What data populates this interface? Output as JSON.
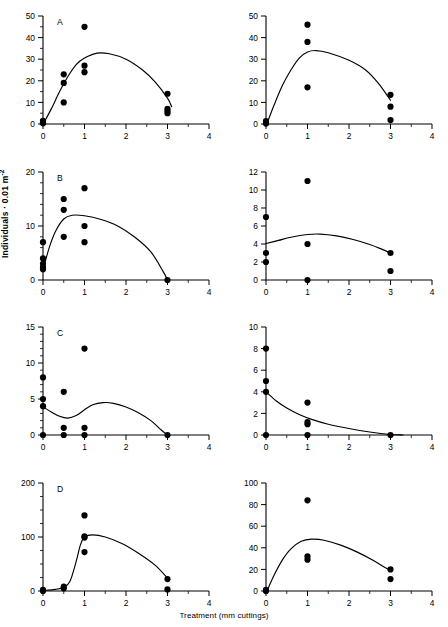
{
  "figure": {
    "xlabel": "Treatment (mm cuttings)",
    "ylabel_main": "Individuals · 0.01 m",
    "ylabel_exp": "-2",
    "ylabel_full": "Individuals · 0.01 m-2"
  },
  "chart_data": [
    {
      "id": "panel-A-left",
      "type": "scatter",
      "panel_label": "A",
      "xlabel": "Treatment (mm cuttings)",
      "ylabel": "Individuals · 0.01 m-2",
      "xlim": [
        0,
        4
      ],
      "ylim": [
        0,
        50
      ],
      "xticks": [
        0,
        1,
        2,
        3,
        4
      ],
      "yticks": [
        0,
        10,
        20,
        30,
        40,
        50
      ],
      "minor_xticks": [
        0.5,
        1.5,
        2.5,
        3.5
      ],
      "minor_yticks": [
        5,
        15,
        25,
        35,
        45
      ],
      "grid": false,
      "legend": "none",
      "points": [
        {
          "x": 0,
          "y": 1.5
        },
        {
          "x": 0,
          "y": 0.8
        },
        {
          "x": 0,
          "y": 0.3
        },
        {
          "x": 0.5,
          "y": 23
        },
        {
          "x": 0.5,
          "y": 19
        },
        {
          "x": 0.5,
          "y": 10
        },
        {
          "x": 1,
          "y": 45
        },
        {
          "x": 1,
          "y": 27
        },
        {
          "x": 1,
          "y": 24
        },
        {
          "x": 3,
          "y": 14
        },
        {
          "x": 3,
          "y": 7
        },
        {
          "x": 3,
          "y": 6
        },
        {
          "x": 3,
          "y": 5
        }
      ],
      "curve": [
        {
          "x": 0.02,
          "y": 0.5
        },
        {
          "x": 0.2,
          "y": 7
        },
        {
          "x": 0.4,
          "y": 15
        },
        {
          "x": 0.6,
          "y": 22
        },
        {
          "x": 0.8,
          "y": 27.5
        },
        {
          "x": 1.0,
          "y": 30.5
        },
        {
          "x": 1.3,
          "y": 32.8
        },
        {
          "x": 1.6,
          "y": 32.5
        },
        {
          "x": 2.0,
          "y": 30
        },
        {
          "x": 2.4,
          "y": 25
        },
        {
          "x": 2.7,
          "y": 19.5
        },
        {
          "x": 3.0,
          "y": 12
        },
        {
          "x": 3.1,
          "y": 8
        }
      ]
    },
    {
      "id": "panel-A-right",
      "type": "scatter",
      "panel_label": "",
      "xlim": [
        0,
        4
      ],
      "ylim": [
        0,
        50
      ],
      "xticks": [
        0,
        1,
        2,
        3,
        4
      ],
      "yticks": [
        0,
        10,
        20,
        30,
        40,
        50
      ],
      "minor_xticks": [
        0.5,
        1.5,
        2.5,
        3.5
      ],
      "minor_yticks": [],
      "grid": false,
      "points": [
        {
          "x": 0,
          "y": 1.4
        },
        {
          "x": 0,
          "y": 0.6
        },
        {
          "x": 0,
          "y": 0.2
        },
        {
          "x": 1,
          "y": 46
        },
        {
          "x": 1,
          "y": 38
        },
        {
          "x": 1,
          "y": 17
        },
        {
          "x": 3,
          "y": 13.5
        },
        {
          "x": 3,
          "y": 8
        },
        {
          "x": 3,
          "y": 1.8
        }
      ],
      "curve": [
        {
          "x": 0.03,
          "y": 0.5
        },
        {
          "x": 0.2,
          "y": 9
        },
        {
          "x": 0.4,
          "y": 18
        },
        {
          "x": 0.6,
          "y": 25
        },
        {
          "x": 0.8,
          "y": 30.5
        },
        {
          "x": 1.0,
          "y": 33.3
        },
        {
          "x": 1.2,
          "y": 34
        },
        {
          "x": 1.5,
          "y": 33
        },
        {
          "x": 2.0,
          "y": 29.5
        },
        {
          "x": 2.4,
          "y": 25
        },
        {
          "x": 2.7,
          "y": 19
        },
        {
          "x": 3.0,
          "y": 11
        }
      ]
    },
    {
      "id": "panel-B-left",
      "type": "scatter",
      "panel_label": "B",
      "xlim": [
        0,
        4
      ],
      "ylim": [
        0,
        20
      ],
      "xticks": [
        0,
        1,
        2,
        3,
        4
      ],
      "yticks": [
        0,
        10,
        20
      ],
      "minor_xticks": [
        0.5,
        1.5,
        2.5,
        3.5
      ],
      "minor_yticks": [
        2,
        4,
        6,
        8,
        12,
        14,
        16,
        18
      ],
      "grid": false,
      "points": [
        {
          "x": 0,
          "y": 7
        },
        {
          "x": 0,
          "y": 4
        },
        {
          "x": 0,
          "y": 3
        },
        {
          "x": 0,
          "y": 2.4
        },
        {
          "x": 0,
          "y": 2.0
        },
        {
          "x": 0.5,
          "y": 15
        },
        {
          "x": 0.5,
          "y": 13
        },
        {
          "x": 0.5,
          "y": 8
        },
        {
          "x": 1,
          "y": 17
        },
        {
          "x": 1,
          "y": 10
        },
        {
          "x": 1,
          "y": 7
        },
        {
          "x": 3,
          "y": 0
        }
      ],
      "curve": [
        {
          "x": 0.02,
          "y": 2.4
        },
        {
          "x": 0.15,
          "y": 6
        },
        {
          "x": 0.3,
          "y": 9
        },
        {
          "x": 0.5,
          "y": 11.3
        },
        {
          "x": 0.7,
          "y": 12.0
        },
        {
          "x": 1.0,
          "y": 11.9
        },
        {
          "x": 1.4,
          "y": 11.2
        },
        {
          "x": 1.8,
          "y": 10
        },
        {
          "x": 2.2,
          "y": 8
        },
        {
          "x": 2.6,
          "y": 5.2
        },
        {
          "x": 2.9,
          "y": 1.5
        },
        {
          "x": 3.0,
          "y": 0
        }
      ]
    },
    {
      "id": "panel-B-right",
      "type": "scatter",
      "panel_label": "",
      "xlim": [
        0,
        4
      ],
      "ylim": [
        0,
        12
      ],
      "xticks": [
        0,
        1,
        2,
        3,
        4
      ],
      "yticks": [
        0,
        2,
        4,
        6,
        8,
        10,
        12
      ],
      "minor_xticks": [
        0.5,
        1.5,
        2.5,
        3.5
      ],
      "minor_yticks": [],
      "grid": false,
      "points": [
        {
          "x": 0,
          "y": 7
        },
        {
          "x": 0,
          "y": 3
        },
        {
          "x": 0,
          "y": 2
        },
        {
          "x": 1,
          "y": 11
        },
        {
          "x": 1,
          "y": 4
        },
        {
          "x": 1,
          "y": 0
        },
        {
          "x": 3,
          "y": 3
        },
        {
          "x": 3,
          "y": 1
        }
      ],
      "curve": [
        {
          "x": 0.0,
          "y": 4.05
        },
        {
          "x": 0.3,
          "y": 4.4
        },
        {
          "x": 0.6,
          "y": 4.75
        },
        {
          "x": 1.0,
          "y": 5.05
        },
        {
          "x": 1.3,
          "y": 5.1
        },
        {
          "x": 1.7,
          "y": 4.9
        },
        {
          "x": 2.1,
          "y": 4.5
        },
        {
          "x": 2.5,
          "y": 3.95
        },
        {
          "x": 2.8,
          "y": 3.4
        },
        {
          "x": 3.0,
          "y": 3.0
        }
      ]
    },
    {
      "id": "panel-C-left",
      "type": "scatter",
      "panel_label": "C",
      "xlim": [
        0,
        4
      ],
      "ylim": [
        0,
        15
      ],
      "xticks": [
        0,
        1,
        2,
        3,
        4
      ],
      "yticks": [
        0,
        5,
        10,
        15
      ],
      "minor_xticks": [
        0.5,
        1.5,
        2.5,
        3.5
      ],
      "minor_yticks": [
        1,
        2,
        3,
        4,
        6,
        7,
        8,
        9,
        11,
        12,
        13,
        14
      ],
      "grid": false,
      "points": [
        {
          "x": 0,
          "y": 8
        },
        {
          "x": 0,
          "y": 5
        },
        {
          "x": 0,
          "y": 4
        },
        {
          "x": 0,
          "y": 0
        },
        {
          "x": 0.5,
          "y": 6
        },
        {
          "x": 0.5,
          "y": 1
        },
        {
          "x": 0.5,
          "y": 0
        },
        {
          "x": 1,
          "y": 12
        },
        {
          "x": 1,
          "y": 1
        },
        {
          "x": 1,
          "y": 0
        },
        {
          "x": 3,
          "y": 0
        }
      ],
      "curve": [
        {
          "x": 0.0,
          "y": 3.9
        },
        {
          "x": 0.2,
          "y": 3.2
        },
        {
          "x": 0.4,
          "y": 2.6
        },
        {
          "x": 0.6,
          "y": 2.35
        },
        {
          "x": 0.8,
          "y": 2.7
        },
        {
          "x": 1.0,
          "y": 3.5
        },
        {
          "x": 1.2,
          "y": 4.2
        },
        {
          "x": 1.45,
          "y": 4.5
        },
        {
          "x": 1.7,
          "y": 4.4
        },
        {
          "x": 2.0,
          "y": 3.9
        },
        {
          "x": 2.3,
          "y": 3.1
        },
        {
          "x": 2.6,
          "y": 2.0
        },
        {
          "x": 2.85,
          "y": 0.7
        },
        {
          "x": 3.0,
          "y": 0
        }
      ]
    },
    {
      "id": "panel-C-right",
      "type": "scatter",
      "panel_label": "",
      "xlim": [
        0,
        4
      ],
      "ylim": [
        0,
        10
      ],
      "xticks": [
        0,
        1,
        2,
        3,
        4
      ],
      "yticks": [
        0,
        2,
        4,
        6,
        8,
        10
      ],
      "minor_xticks": [
        0.5,
        1.5,
        2.5,
        3.5
      ],
      "minor_yticks": [],
      "grid": false,
      "points": [
        {
          "x": 0,
          "y": 8
        },
        {
          "x": 0,
          "y": 5
        },
        {
          "x": 0,
          "y": 4
        },
        {
          "x": 0,
          "y": 0
        },
        {
          "x": 1,
          "y": 3
        },
        {
          "x": 1,
          "y": 1.2
        },
        {
          "x": 1,
          "y": 1.0
        },
        {
          "x": 1,
          "y": 0
        },
        {
          "x": 3,
          "y": 0
        }
      ],
      "curve": [
        {
          "x": 0.0,
          "y": 4.0
        },
        {
          "x": 0.25,
          "y": 3.15
        },
        {
          "x": 0.5,
          "y": 2.5
        },
        {
          "x": 0.8,
          "y": 1.9
        },
        {
          "x": 1.1,
          "y": 1.45
        },
        {
          "x": 1.5,
          "y": 1.0
        },
        {
          "x": 2.0,
          "y": 0.6
        },
        {
          "x": 2.5,
          "y": 0.28
        },
        {
          "x": 3.0,
          "y": 0.05
        },
        {
          "x": 3.3,
          "y": 0.0
        }
      ]
    },
    {
      "id": "panel-D-left",
      "type": "scatter",
      "panel_label": "D",
      "xlim": [
        0,
        4
      ],
      "ylim": [
        0,
        200
      ],
      "xticks": [
        0,
        1,
        2,
        3,
        4
      ],
      "yticks": [
        0,
        100,
        200
      ],
      "minor_xticks": [
        0.5,
        1.5,
        2.5,
        3.5
      ],
      "minor_yticks": [
        25,
        50,
        75,
        125,
        150,
        175
      ],
      "grid": false,
      "points": [
        {
          "x": 0,
          "y": 2
        },
        {
          "x": 0,
          "y": 0
        },
        {
          "x": 0.5,
          "y": 8
        },
        {
          "x": 0.5,
          "y": 5
        },
        {
          "x": 1,
          "y": 140
        },
        {
          "x": 1,
          "y": 101
        },
        {
          "x": 1,
          "y": 99
        },
        {
          "x": 1,
          "y": 72
        },
        {
          "x": 3,
          "y": 22
        },
        {
          "x": 3,
          "y": 3
        }
      ],
      "curve": [
        {
          "x": 0.0,
          "y": 1.0
        },
        {
          "x": 0.3,
          "y": 3.0
        },
        {
          "x": 0.5,
          "y": 7
        },
        {
          "x": 0.65,
          "y": 18
        },
        {
          "x": 0.8,
          "y": 55
        },
        {
          "x": 0.9,
          "y": 85
        },
        {
          "x": 1.0,
          "y": 100
        },
        {
          "x": 1.2,
          "y": 104
        },
        {
          "x": 1.5,
          "y": 100
        },
        {
          "x": 1.9,
          "y": 88
        },
        {
          "x": 2.3,
          "y": 70
        },
        {
          "x": 2.7,
          "y": 48
        },
        {
          "x": 3.0,
          "y": 24
        }
      ]
    },
    {
      "id": "panel-D-right",
      "type": "scatter",
      "panel_label": "",
      "xlim": [
        0,
        4
      ],
      "ylim": [
        0,
        100
      ],
      "xticks": [
        0,
        1,
        2,
        3,
        4
      ],
      "yticks": [
        0,
        20,
        40,
        60,
        80,
        100
      ],
      "minor_xticks": [
        0.5,
        1.5,
        2.5,
        3.5
      ],
      "minor_yticks": [],
      "grid": false,
      "points": [
        {
          "x": 0,
          "y": 1
        },
        {
          "x": 0,
          "y": 0
        },
        {
          "x": 1,
          "y": 84
        },
        {
          "x": 1,
          "y": 32
        },
        {
          "x": 1,
          "y": 29
        },
        {
          "x": 3,
          "y": 20
        },
        {
          "x": 3,
          "y": 11
        }
      ],
      "curve": [
        {
          "x": 0.03,
          "y": 0.5
        },
        {
          "x": 0.2,
          "y": 15
        },
        {
          "x": 0.4,
          "y": 29
        },
        {
          "x": 0.6,
          "y": 39
        },
        {
          "x": 0.85,
          "y": 46
        },
        {
          "x": 1.1,
          "y": 48
        },
        {
          "x": 1.4,
          "y": 47
        },
        {
          "x": 1.8,
          "y": 42.5
        },
        {
          "x": 2.2,
          "y": 36
        },
        {
          "x": 2.6,
          "y": 28
        },
        {
          "x": 2.9,
          "y": 21
        },
        {
          "x": 3.0,
          "y": 19.5
        }
      ]
    }
  ]
}
